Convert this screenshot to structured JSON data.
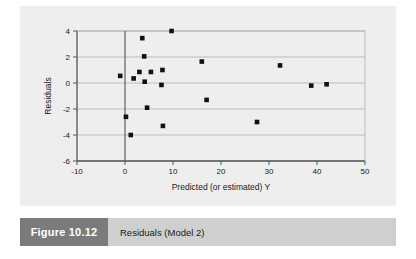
{
  "figure": {
    "number_label": "Figure 10.12",
    "caption": "Residuals (Model 2)"
  },
  "colors": {
    "panel_background": "#eeeeee",
    "caption_band": "#cfcfcf",
    "figure_number_box": "#7b7b7b",
    "figure_number_text": "#ffffff",
    "grid_line": "#a8a8a8",
    "axis_line": "#555555",
    "marker": "#111111",
    "text": "#1a1a1a"
  },
  "chart_data": {
    "type": "scatter",
    "title": "",
    "xlabel": "Predicted (or estimated) Y",
    "ylabel": "Residuals",
    "xlim": [
      -10,
      50
    ],
    "ylim": [
      -6,
      4
    ],
    "xticks": [
      -10,
      0,
      10,
      20,
      30,
      40,
      50
    ],
    "xtick_labels": [
      "-10",
      "0",
      "10",
      "20",
      "30",
      "40",
      "50"
    ],
    "yticks": [
      4,
      2,
      0,
      -2,
      -4,
      -6
    ],
    "ytick_labels": [
      "4",
      "2",
      "0",
      "-2",
      "-4",
      "-6"
    ],
    "grid": "horizontal",
    "legend": "none",
    "zero_reference_line_x": 0,
    "marker_style": "filled-square",
    "points": [
      {
        "x": -1.0,
        "y": 0.55
      },
      {
        "x": 0.2,
        "y": -2.6
      },
      {
        "x": 1.2,
        "y": -4.0
      },
      {
        "x": 1.8,
        "y": 0.35
      },
      {
        "x": 3.0,
        "y": 0.85
      },
      {
        "x": 3.6,
        "y": 3.45
      },
      {
        "x": 4.0,
        "y": 2.05
      },
      {
        "x": 4.1,
        "y": 0.1
      },
      {
        "x": 4.6,
        "y": -1.9
      },
      {
        "x": 5.4,
        "y": 0.85
      },
      {
        "x": 7.6,
        "y": -0.15
      },
      {
        "x": 7.8,
        "y": 1.0
      },
      {
        "x": 7.9,
        "y": -3.3
      },
      {
        "x": 9.7,
        "y": 4.0
      },
      {
        "x": 16.0,
        "y": 1.65
      },
      {
        "x": 17.0,
        "y": -1.3
      },
      {
        "x": 27.5,
        "y": -3.0
      },
      {
        "x": 32.3,
        "y": 1.35
      },
      {
        "x": 38.8,
        "y": -0.2
      },
      {
        "x": 42.0,
        "y": -0.1
      }
    ]
  }
}
